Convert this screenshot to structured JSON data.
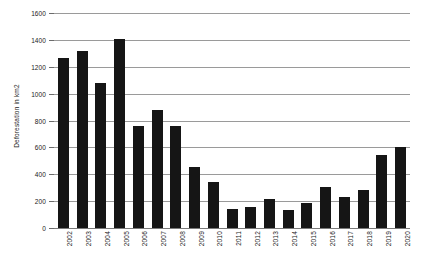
{
  "chart_data": {
    "type": "bar",
    "title": "",
    "xlabel": "",
    "ylabel": "Deforestation in km2",
    "ylim": [
      0,
      1600
    ],
    "ytick_step": 200,
    "yticks": [
      0,
      200,
      400,
      600,
      800,
      1000,
      1200,
      1400,
      1600
    ],
    "ytick_labels": [
      "0",
      "200",
      "400",
      "600",
      "800",
      "1000",
      "1200",
      "1400",
      "1600"
    ],
    "grid": true,
    "legend": false,
    "bar_color": "#151515",
    "grid_color": "#9a9a9a",
    "categories": [
      "2002",
      "2003",
      "2004",
      "2005",
      "2006",
      "2007",
      "2008",
      "2009",
      "2010",
      "2011",
      "2012",
      "2013",
      "2014",
      "2015",
      "2016",
      "2017",
      "2018",
      "2019",
      "2020"
    ],
    "values": [
      1265,
      1320,
      1080,
      1410,
      760,
      880,
      760,
      455,
      345,
      145,
      160,
      215,
      135,
      185,
      305,
      230,
      285,
      540,
      605
    ]
  }
}
